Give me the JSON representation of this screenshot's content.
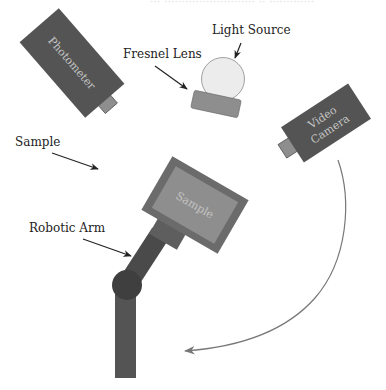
{
  "header": {
    "cropped_title": "··· ·························· ·· ·············"
  },
  "components": {
    "photometer": {
      "label": "Photometer"
    },
    "light_source": {
      "label": "Light Source"
    },
    "fresnel_lens": {
      "label": "Fresnel Lens"
    },
    "video_camera": {
      "label_line1": "Video",
      "label_line2": "Camera"
    },
    "sample": {
      "label": "Sample",
      "holder_label": "Sample"
    },
    "robotic_arm": {
      "label": "Robotic Arm"
    }
  },
  "colors": {
    "device_dark": "#545454",
    "device_mid": "#6b6b6b",
    "device_light": "#8e8e8e",
    "light_source_fill": "#ececec",
    "arm_joint": "#3f3f3f",
    "arrow": "#222222",
    "path_arrow": "#777777"
  }
}
